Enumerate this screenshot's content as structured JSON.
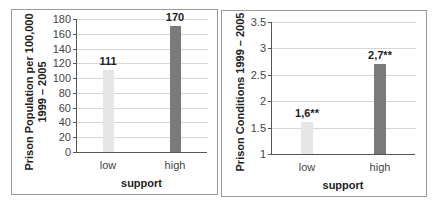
{
  "chart_data": [
    {
      "type": "bar",
      "title": "",
      "categories": [
        "low",
        "high"
      ],
      "values": [
        111,
        170
      ],
      "bar_labels": [
        "111",
        "170"
      ],
      "bar_colors": [
        "#e6e6e6",
        "#7a7a7a"
      ],
      "xlabel": "support",
      "ylabel_lines": [
        "Prison Population per 100,000",
        "1999 – 2005"
      ],
      "ylim": [
        0,
        180
      ],
      "yticks": [
        "0",
        "20",
        "40",
        "60",
        "80",
        "100",
        "120",
        "140",
        "160",
        "180"
      ],
      "grid": true,
      "legend": null
    },
    {
      "type": "bar",
      "title": "",
      "categories": [
        "low",
        "high"
      ],
      "values": [
        1.6,
        2.7
      ],
      "bar_labels": [
        "1,6**",
        "2,7**"
      ],
      "bar_colors": [
        "#e6e6e6",
        "#7a7a7a"
      ],
      "xlabel": "support",
      "ylabel_lines": [
        "Prison Conditions  1999 – 2005"
      ],
      "ylim": [
        1,
        3.5
      ],
      "yticks": [
        "1",
        "1.5",
        "2",
        "2.5",
        "3",
        "3.5"
      ],
      "grid": true,
      "legend": null
    }
  ]
}
